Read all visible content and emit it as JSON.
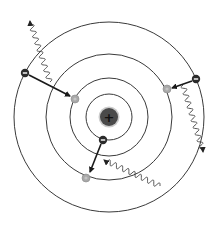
{
  "diagram": {
    "colors": {
      "background": "#ffffff",
      "orbit": "#3a3a3a",
      "nucleus": "#4a4a4a",
      "nucleus_glyph": "#111111",
      "electron_filled": "#2b2b2b",
      "electron_empty": "#a8a8a8",
      "arrow": "#1a1a1a",
      "photon": "#444444"
    },
    "nucleus": {
      "cx": 109,
      "cy": 117,
      "r": 9,
      "symbol": "+"
    },
    "orbits": [
      {
        "n": 1,
        "r": 23
      },
      {
        "n": 2,
        "r": 39
      },
      {
        "n": 3,
        "r": 63
      },
      {
        "n": 4,
        "r": 95
      }
    ],
    "electrons": [
      {
        "id": "outer-left-initial",
        "cx": 25,
        "cy": 73,
        "state": "filled",
        "symbol": "−"
      },
      {
        "id": "outer-left-final",
        "cx": 75,
        "cy": 99,
        "state": "empty"
      },
      {
        "id": "right-initial",
        "cx": 196,
        "cy": 79,
        "state": "filled",
        "symbol": "−"
      },
      {
        "id": "right-final",
        "cx": 167,
        "cy": 89,
        "state": "empty"
      },
      {
        "id": "inner-initial",
        "cx": 103,
        "cy": 140,
        "state": "filled",
        "symbol": "−"
      },
      {
        "id": "inner-final",
        "cx": 86,
        "cy": 178,
        "state": "empty"
      }
    ],
    "transitions": [
      {
        "from": "outer-left-initial",
        "to": "outer-left-final",
        "x1": 29,
        "y1": 75,
        "x2": 70,
        "y2": 96
      },
      {
        "from": "right-initial",
        "to": "right-final",
        "x1": 192,
        "y1": 81,
        "x2": 172,
        "y2": 88
      },
      {
        "from": "inner-initial",
        "to": "inner-final",
        "x1": 101,
        "y1": 144,
        "x2": 90,
        "y2": 172
      }
    ],
    "photons": [
      {
        "id": "photon-top-left",
        "direction": "outgoing",
        "x1": 50,
        "y1": 82,
        "x2": 30,
        "y2": 21
      },
      {
        "id": "photon-right",
        "direction": "outgoing",
        "x1": 183,
        "y1": 85,
        "x2": 203,
        "y2": 152
      },
      {
        "id": "photon-bottom",
        "direction": "incoming",
        "x1": 160,
        "y1": 186,
        "x2": 104,
        "y2": 160
      }
    ]
  }
}
